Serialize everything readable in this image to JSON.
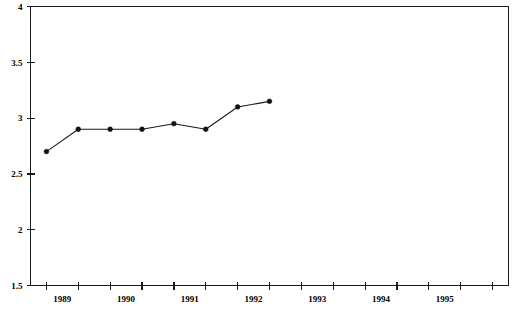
{
  "chart_data": {
    "type": "line",
    "title": "",
    "subtitle": "",
    "xlabel": "",
    "ylabel": "",
    "grid": false,
    "legend": false,
    "legend_position": "none",
    "ylim": [
      1.5,
      4
    ],
    "y_ticks": [
      "1.5",
      "2",
      "2.5",
      "3",
      "3.5",
      "4"
    ],
    "y_tick_values": [
      1.5,
      2,
      2.5,
      3,
      3.5,
      4
    ],
    "xlim": [
      1988.75,
      1996.25
    ],
    "x_tick_labels": [
      "1989",
      "1990",
      "1991",
      "1992",
      "1993",
      "1994",
      "1995"
    ],
    "x_tick_label_values": [
      1989,
      1990,
      1991,
      1992,
      1993,
      1994,
      1995
    ],
    "x_minor_tick_values": [
      1989.0,
      1989.5,
      1990.0,
      1990.5,
      1991.0,
      1991.5,
      1992.0,
      1992.5,
      1993.0,
      1993.5,
      1994.0,
      1994.5,
      1995.0,
      1995.5,
      1996.0
    ],
    "series": [
      {
        "name": "series-1",
        "marker": "filled-circle",
        "color": "#111111",
        "x": [
          1989.0,
          1989.5,
          1990.0,
          1990.5,
          1991.0,
          1991.5,
          1992.0,
          1992.5
        ],
        "values": [
          2.7,
          2.9,
          2.9,
          2.9,
          2.95,
          2.9,
          3.1,
          3.15
        ]
      }
    ]
  }
}
